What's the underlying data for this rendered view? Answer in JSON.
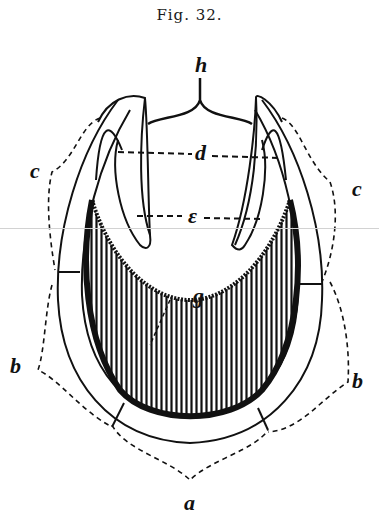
{
  "figure": {
    "caption": "Fig. 32.",
    "labels": {
      "h": "h",
      "d": "d",
      "e": "ε",
      "c_left": "c",
      "c_right": "c",
      "g": "g",
      "b_left": "b",
      "b_right": "b",
      "a": "a"
    },
    "colors": {
      "ink": "#111111",
      "paper": "#ffffff",
      "scanline": "#d2d2d2"
    }
  }
}
